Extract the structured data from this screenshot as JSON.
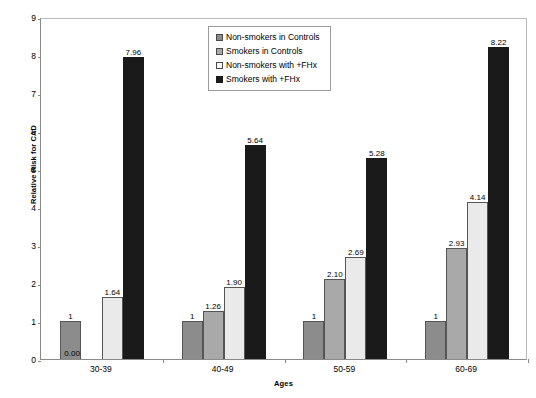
{
  "chart_data": {
    "type": "bar",
    "title": "",
    "xlabel": "Ages",
    "ylabel": "Relative Risk for CAD",
    "categories": [
      "30-39",
      "40-49",
      "50-59",
      "60-69"
    ],
    "ylim": [
      0,
      9
    ],
    "yticks": [
      0,
      1,
      2,
      3,
      4,
      5,
      6,
      7,
      8,
      9
    ],
    "ytick_labels": [
      "0",
      "1",
      "2",
      "3",
      "4",
      "5",
      "6",
      "7",
      "8",
      "9"
    ],
    "grid": false,
    "legend_position": "top-center",
    "series": [
      {
        "name": "Non-smokers in Controls",
        "color": "#8c8c8c",
        "values": [
          1,
          1,
          1,
          1
        ],
        "labels": [
          "1",
          "1",
          "1",
          "1"
        ]
      },
      {
        "name": "Smokers in Controls",
        "color": "#a9a9a9",
        "values": [
          0.0,
          1.26,
          2.1,
          2.93
        ],
        "labels": [
          "0.00",
          "1.26",
          "2.10",
          "2.93"
        ]
      },
      {
        "name": "Non-smokers with +FHx",
        "color": "#eaeaea",
        "values": [
          1.64,
          1.9,
          2.69,
          4.14
        ],
        "labels": [
          "1.64",
          "1.90",
          "2.69",
          "4.14"
        ]
      },
      {
        "name": "Smokers with +FHx",
        "color": "#1a1a1a",
        "values": [
          7.96,
          5.64,
          5.28,
          8.22
        ],
        "labels": [
          "7.96",
          "5.64",
          "5.28",
          "8.22"
        ]
      }
    ]
  }
}
